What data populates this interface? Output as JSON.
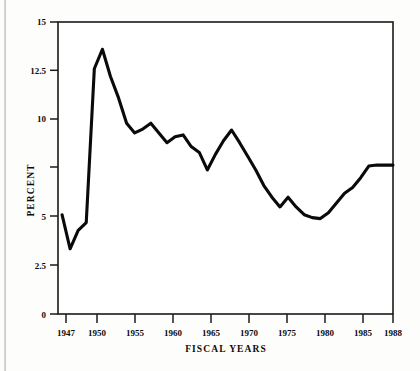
{
  "chart_data": {
    "type": "line",
    "title": "",
    "subtitle": "",
    "xlabel": "FISCAL YEARS",
    "ylabel": "PERCENT",
    "xlim": [
      1946.5,
      1988
    ],
    "ylim": [
      0,
      15
    ],
    "grid": false,
    "legend": "none",
    "line_color": "#0a0a0a",
    "axis_color": "#1a1a1a",
    "background_color": "#fdfdfb",
    "x_tick_labels": [
      "1947",
      "1950",
      "1955",
      "1960",
      "1965",
      "1970",
      "1975",
      "1980",
      "1985",
      "1988"
    ],
    "x_tick_values": [
      1947,
      1950,
      1955,
      1960,
      1965,
      1970,
      1975,
      1980,
      1985,
      1988
    ],
    "y_tick_labels": [
      "0",
      "2.5",
      "5",
      "",
      "10",
      "12.5",
      "15"
    ],
    "y_tick_values": [
      0,
      2.5,
      5,
      7.5,
      10,
      12.5,
      15
    ],
    "x": [
      1947,
      1948,
      1949,
      1950,
      1951,
      1952,
      1953,
      1954,
      1955,
      1956,
      1957,
      1958,
      1959,
      1960,
      1961,
      1962,
      1963,
      1964,
      1965,
      1966,
      1967,
      1968,
      1969,
      1970,
      1971,
      1972,
      1973,
      1974,
      1975,
      1976,
      1977,
      1978,
      1979,
      1980,
      1981,
      1982,
      1983,
      1984,
      1985,
      1986,
      1987,
      1988
    ],
    "values": [
      5.1,
      3.35,
      4.3,
      4.7,
      12.6,
      13.6,
      12.2,
      11.1,
      9.8,
      9.3,
      9.5,
      9.8,
      9.3,
      8.8,
      9.1,
      9.2,
      8.6,
      8.3,
      7.4,
      8.2,
      8.9,
      9.45,
      8.8,
      8.1,
      7.4,
      6.6,
      6.0,
      5.5,
      6.0,
      5.5,
      5.1,
      4.95,
      4.9,
      5.2,
      5.7,
      6.2,
      6.5,
      7.0,
      7.6,
      7.65,
      7.65,
      7.65
    ],
    "series_name": "Percent of GNP"
  },
  "figure": {
    "caption": "",
    "x_axis_title": "FISCAL YEARS",
    "y_axis_title": "PERCENT"
  }
}
